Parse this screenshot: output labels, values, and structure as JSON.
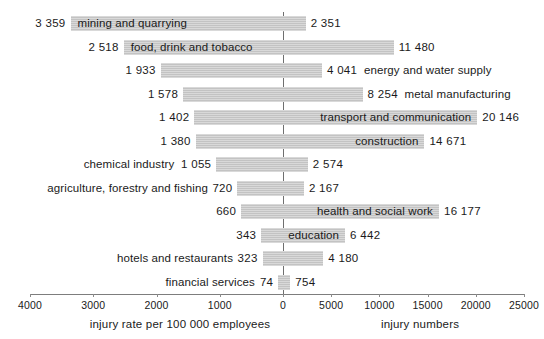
{
  "chart_data": {
    "type": "bar",
    "title": "",
    "subtitle": "",
    "orientation": "horizontal-bidirectional",
    "grid": false,
    "legend": null,
    "left_axis": {
      "label": "injury rate per 100 000 employees",
      "ticks": [
        "4000",
        "3000",
        "2000",
        "1000",
        "0"
      ],
      "tick_values": [
        4000,
        3000,
        2000,
        1000,
        0
      ],
      "range": [
        0,
        4000
      ],
      "direction": "right-to-left"
    },
    "right_axis": {
      "label": "injury numbers",
      "ticks": [
        "0",
        "5000",
        "10000",
        "15000",
        "20000",
        "25000"
      ],
      "tick_values": [
        0,
        5000,
        10000,
        15000,
        20000,
        25000
      ],
      "range": [
        0,
        25000
      ],
      "direction": "left-to-right"
    },
    "categories": [
      "mining and quarrying",
      "food, drink and tobacco",
      "energy and water supply",
      "metal manufacturing",
      "transport and communication",
      "construction",
      "chemical industry",
      "agriculture, forestry and fishing",
      "health and social work",
      "education",
      "hotels and restaurants",
      "financial services"
    ],
    "series": [
      {
        "name": "injury rate per 100 000 employees",
        "values": [
          3359,
          2518,
          1933,
          1578,
          1402,
          1380,
          1055,
          720,
          660,
          343,
          323,
          74
        ]
      },
      {
        "name": "injury numbers",
        "values": [
          2351,
          11480,
          4041,
          8254,
          20146,
          14671,
          2574,
          2167,
          16177,
          6442,
          4180,
          754
        ]
      }
    ],
    "rows": [
      {
        "category": "mining and quarrying",
        "rate": 3359,
        "rate_text": "3 359",
        "number": 2351,
        "number_text": "2 351",
        "label_side": "left",
        "label_on_bar": true
      },
      {
        "category": "food, drink and tobacco",
        "rate": 2518,
        "rate_text": "2 518",
        "number": 11480,
        "number_text": "11 480",
        "label_side": "left",
        "label_on_bar": true
      },
      {
        "category": "energy and water supply",
        "rate": 1933,
        "rate_text": "1 933",
        "number": 4041,
        "number_text": "4 041",
        "label_side": "right",
        "label_on_bar": false
      },
      {
        "category": "metal manufacturing",
        "rate": 1578,
        "rate_text": "1 578",
        "number": 8254,
        "number_text": "8 254",
        "label_side": "right",
        "label_on_bar": false
      },
      {
        "category": "transport and communication",
        "rate": 1402,
        "rate_text": "1 402",
        "number": 20146,
        "number_text": "20 146",
        "label_side": "right",
        "label_on_bar": true
      },
      {
        "category": "construction",
        "rate": 1380,
        "rate_text": "1 380",
        "number": 14671,
        "number_text": "14 671",
        "label_side": "right",
        "label_on_bar": true
      },
      {
        "category": "chemical industry",
        "rate": 1055,
        "rate_text": "1 055",
        "number": 2574,
        "number_text": "2 574",
        "label_side": "left",
        "label_on_bar": false
      },
      {
        "category": "agriculture, forestry and fishing",
        "rate": 720,
        "rate_text": "720",
        "number": 2167,
        "number_text": "2 167",
        "label_side": "left",
        "label_on_bar": false
      },
      {
        "category": "health and social work",
        "rate": 660,
        "rate_text": "660",
        "number": 16177,
        "number_text": "16 177",
        "label_side": "right",
        "label_on_bar": true
      },
      {
        "category": "education",
        "rate": 343,
        "rate_text": "343",
        "number": 6442,
        "number_text": "6 442",
        "label_side": "right",
        "label_on_bar": true
      },
      {
        "category": "hotels and restaurants",
        "rate": 323,
        "rate_text": "323",
        "number": 4180,
        "number_text": "4 180",
        "label_side": "left",
        "label_on_bar": false
      },
      {
        "category": "financial services",
        "rate": 74,
        "rate_text": "74",
        "number": 754,
        "number_text": "754",
        "label_side": "left",
        "label_on_bar": false
      }
    ],
    "colors": {
      "bar": "#c9c9c9",
      "axis": "#7d7d7d",
      "zero_line": "#6f6f6f",
      "text": "#1a1a1a",
      "background": "#ffffff"
    }
  }
}
